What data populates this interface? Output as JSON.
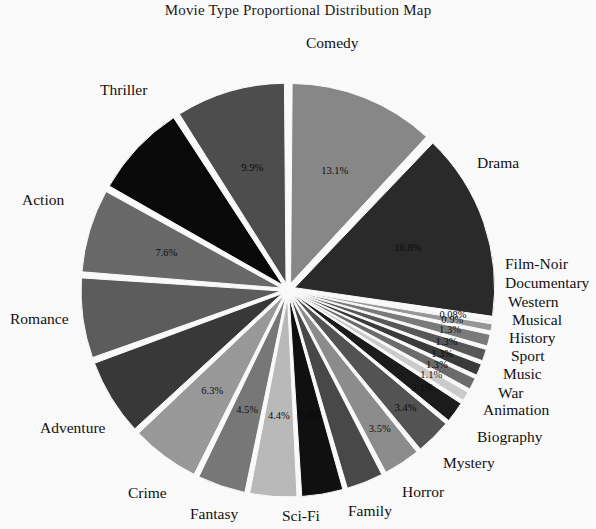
{
  "chart_data": {
    "type": "pie",
    "title": "Movie Type Proportional Distribution Map",
    "xlabel": "",
    "ylabel": "",
    "legend_position": "none",
    "exploded": true,
    "labels_outside": true,
    "categories": [
      "Comedy",
      "Drama",
      "Film-Noir",
      "Documentary",
      "Western",
      "Musical",
      "History",
      "Sport",
      "Music",
      "War",
      "Animation",
      "Biography",
      "Mystery",
      "Horror",
      "Family",
      "Sci-Fi",
      "Fantasy",
      "Crime",
      "Adventure",
      "Romance",
      "Action",
      "Thriller"
    ],
    "values": [
      13.1,
      16.8,
      0.08,
      0.9,
      1.3,
      1.3,
      1.3,
      1.3,
      1.1,
      2.1,
      3.4,
      3.5,
      3.5,
      3.9,
      4.4,
      4.5,
      6.3,
      7.0,
      7.3,
      7.6,
      8.5,
      9.9
    ],
    "value_labels": [
      "13.1%",
      "16.8%",
      "0.08%",
      "0.9%",
      "1.3%",
      "1.3%",
      "1.3%",
      "1.3%",
      "1.1%",
      "2.1%",
      "3.4%",
      "3.5%",
      "",
      "3.9%",
      "4.4%",
      "4.5%",
      "6.3%",
      "",
      "",
      "7.6%",
      "",
      "9.9%"
    ],
    "slice_colors": [
      "#8a8a8a",
      "#2b2b2b",
      "#f2f2f2",
      "#9a9a9a",
      "#7d7d7d",
      "#5a5a5a",
      "#3c3c3c",
      "#6e6e6e",
      "#cfcfcf",
      "#1c1c1c",
      "#555555",
      "#8f8f8f",
      "#4a4a4a",
      "#111111",
      "#bdbdbd",
      "#7a7a7a",
      "#9c9c9c",
      "#3a3a3a",
      "#5e5e5e",
      "#6b6b6b",
      "#0a0a0a",
      "#4f4f4f"
    ]
  },
  "slice_text": {
    "comedy": "Comedy",
    "drama": "Drama",
    "film_noir": "Film-Noir",
    "documentary": "Documentary",
    "western": "Western",
    "musical": "Musical",
    "history": "History",
    "sport": "Sport",
    "music": "Music",
    "war": "War",
    "animation": "Animation",
    "biography": "Biography",
    "mystery": "Mystery",
    "horror": "Horror",
    "family": "Family",
    "scifi": "Sci-Fi",
    "fantasy": "Fantasy",
    "crime": "Crime",
    "adventure": "Adventure",
    "romance": "Romance",
    "action": "Action",
    "thriller": "Thriller"
  },
  "pct_text": {
    "comedy": "13.1%",
    "drama": "16.8%",
    "film_noir": "0.08%",
    "documentary": "0.9%",
    "western": "1.3%",
    "musical": "1.3%",
    "history": "1.3%",
    "sport": "1.3%",
    "music": "1.1%",
    "war": "2.1%",
    "animation": "3.4%",
    "biography": "3.5%",
    "horror": "3.9%",
    "family": "4.4%",
    "scifi": "4.5%",
    "fantasy": "6.3%",
    "romance": "7.6%",
    "thriller": "9.9%"
  }
}
